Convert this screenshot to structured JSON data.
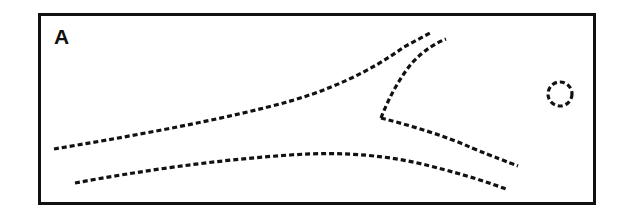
{
  "figure": {
    "panel_label": "A",
    "background_color": "#ffffff",
    "ink_color": "#111111",
    "frame": {
      "name": "panel-border",
      "x": 38,
      "y": 13,
      "width": 558,
      "height": 192,
      "stroke_width": 3,
      "color": "#111111"
    },
    "dash_pattern": "5 3",
    "stroke_width": 3.2,
    "elements": [
      {
        "name": "upper-left-branch",
        "description": "dashed curve entering from lower left, sweeping right and up to the top of the panel",
        "path": "M 54 149 C 120 138, 200 124, 268 107 C 330 92, 372 70, 404 47 L 430 33"
      },
      {
        "name": "right-upper-branch",
        "description": "dashed curve from the V vertex rising to the top right",
        "path": "M 381 118 C 388 100, 398 80, 412 63 C 424 50, 436 43, 446 39"
      },
      {
        "name": "descending-branch-from-vertex",
        "description": "dashed curve from the V vertex descending to the lower right",
        "path": "M 381 118 C 412 126, 446 136, 472 148 C 494 157, 508 162, 518 166"
      },
      {
        "name": "lower-long-curve",
        "description": "long dashed curve entering from lower left, flattening across the middle, then descending to lower right",
        "path": "M 75 183 C 140 171, 215 160, 290 155 C 345 151, 392 156, 430 166 C 466 175, 490 183, 506 189"
      },
      {
        "name": "dashed-circle",
        "description": "small dashed circle on the right side of the panel",
        "cx": 560,
        "cy": 94,
        "r": 12
      }
    ]
  }
}
